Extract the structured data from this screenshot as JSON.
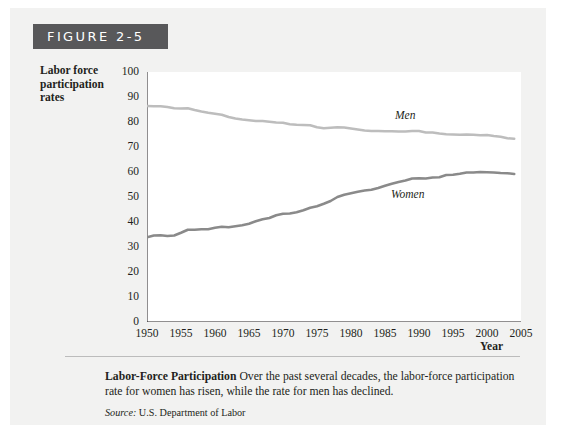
{
  "figure": {
    "header_label": "FIGURE 2-5"
  },
  "caption": {
    "title": "Labor-Force Participation",
    "body": "Over the past several decades, the labor-force participation rate for women has risen, while the rate for men has declined.",
    "source_label": "Source:",
    "source_value": "U.S. Department of Labor"
  },
  "colors": {
    "panel_background": "#f2f2f1",
    "header_bar": "#58585a",
    "plot_background": "#ffffff",
    "axis": "#231f20",
    "men_line": "#bdbdbd",
    "women_line": "#8a8a8a"
  },
  "chart_data": {
    "type": "line",
    "title": "",
    "xlabel": "Year",
    "ylabel": "Labor force participation rates",
    "xlim": [
      1950,
      2005
    ],
    "ylim": [
      0,
      100
    ],
    "grid": false,
    "legend_position": "inline-annotation",
    "y_ticks": [
      0,
      10,
      20,
      30,
      40,
      50,
      60,
      70,
      80,
      90,
      100
    ],
    "x_ticks": [
      1950,
      1955,
      1960,
      1965,
      1970,
      1975,
      1980,
      1985,
      1990,
      1995,
      2000,
      2005
    ],
    "x": [
      1950,
      1951,
      1952,
      1953,
      1954,
      1955,
      1956,
      1957,
      1958,
      1959,
      1960,
      1961,
      1962,
      1963,
      1964,
      1965,
      1966,
      1967,
      1968,
      1969,
      1970,
      1971,
      1972,
      1973,
      1974,
      1975,
      1976,
      1977,
      1978,
      1979,
      1980,
      1981,
      1982,
      1983,
      1984,
      1985,
      1986,
      1987,
      1988,
      1989,
      1990,
      1991,
      1992,
      1993,
      1994,
      1995,
      1996,
      1997,
      1998,
      1999,
      2000,
      2001,
      2002,
      2003,
      2004
    ],
    "series": [
      {
        "name": "Men",
        "values": [
          86.4,
          86.3,
          86.3,
          86.0,
          85.5,
          85.4,
          85.5,
          84.8,
          84.2,
          83.7,
          83.3,
          82.9,
          82.0,
          81.4,
          81.0,
          80.7,
          80.4,
          80.4,
          80.1,
          79.8,
          79.7,
          79.1,
          78.9,
          78.8,
          78.7,
          77.9,
          77.5,
          77.7,
          77.9,
          77.8,
          77.4,
          77.0,
          76.6,
          76.4,
          76.4,
          76.3,
          76.3,
          76.2,
          76.2,
          76.4,
          76.4,
          75.8,
          75.8,
          75.4,
          75.1,
          75.0,
          74.9,
          75.0,
          74.9,
          74.7,
          74.8,
          74.4,
          74.1,
          73.5,
          73.3
        ]
      },
      {
        "name": "Women",
        "values": [
          33.9,
          34.6,
          34.7,
          34.4,
          34.6,
          35.7,
          36.9,
          36.9,
          37.1,
          37.1,
          37.7,
          38.1,
          37.9,
          38.3,
          38.7,
          39.3,
          40.3,
          41.1,
          41.6,
          42.7,
          43.3,
          43.4,
          43.9,
          44.7,
          45.7,
          46.3,
          47.3,
          48.4,
          50.0,
          50.9,
          51.5,
          52.1,
          52.6,
          52.9,
          53.6,
          54.5,
          55.3,
          56.0,
          56.6,
          57.4,
          57.5,
          57.4,
          57.8,
          57.9,
          58.8,
          58.9,
          59.3,
          59.8,
          59.8,
          60.0,
          59.9,
          59.8,
          59.6,
          59.5,
          59.2
        ]
      }
    ],
    "annotations": [
      {
        "text": "Men",
        "x": 1988,
        "y": 81
      },
      {
        "text": "Women",
        "x": 1987,
        "y": 52
      }
    ]
  }
}
